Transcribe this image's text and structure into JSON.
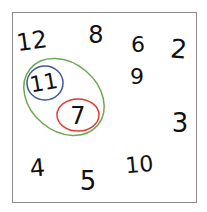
{
  "diagram": {
    "numbers": [
      {
        "label": "12",
        "x": 33,
        "y": 49,
        "size": 24,
        "rotate": -8
      },
      {
        "label": "8",
        "x": 96,
        "y": 43,
        "size": 24,
        "rotate": 0
      },
      {
        "label": "6",
        "x": 138,
        "y": 52,
        "size": 22,
        "rotate": 0
      },
      {
        "label": "2",
        "x": 178,
        "y": 58,
        "size": 26,
        "rotate": 5
      },
      {
        "label": "11",
        "x": 45,
        "y": 90,
        "size": 22,
        "rotate": -10
      },
      {
        "label": "9",
        "x": 137,
        "y": 84,
        "size": 22,
        "rotate": 0
      },
      {
        "label": "7",
        "x": 78,
        "y": 124,
        "size": 24,
        "rotate": 0
      },
      {
        "label": "3",
        "x": 180,
        "y": 132,
        "size": 26,
        "rotate": 0
      },
      {
        "label": "4",
        "x": 38,
        "y": 176,
        "size": 24,
        "rotate": -5
      },
      {
        "label": "5",
        "x": 88,
        "y": 190,
        "size": 26,
        "rotate": 0
      },
      {
        "label": "10",
        "x": 140,
        "y": 172,
        "size": 22,
        "rotate": -5
      }
    ],
    "circles": [
      {
        "name": "green-ellipse",
        "color": "#6aa84f",
        "cx": 64,
        "cy": 97,
        "rx": 44,
        "ry": 34,
        "rotate": 40,
        "encloses": [
          "11",
          "7"
        ]
      },
      {
        "name": "blue-circle",
        "color": "#3c5a9a",
        "cx": 45,
        "cy": 83,
        "rx": 18,
        "ry": 17,
        "rotate": 0,
        "encloses": [
          "11"
        ]
      },
      {
        "name": "red-circle",
        "color": "#e03c31",
        "cx": 78,
        "cy": 115,
        "rx": 21,
        "ry": 16,
        "rotate": 0,
        "encloses": [
          "7"
        ]
      }
    ]
  }
}
